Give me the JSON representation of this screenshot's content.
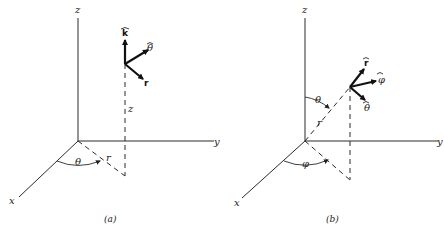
{
  "figure": {
    "panels": [
      {
        "id": "a",
        "caption": "(a)",
        "system": "cylindrical",
        "axis_labels": {
          "x": "x",
          "y": "y",
          "z": "z"
        },
        "unit_vectors": [
          "k̂",
          "θ̂",
          "r"
        ],
        "unit_vector_labels": {
          "k": "k",
          "theta": "θ",
          "r": "r"
        },
        "dimension_labels": {
          "height": "z",
          "radius": "r",
          "angle": "θ"
        }
      },
      {
        "id": "b",
        "caption": "(b)",
        "system": "spherical",
        "axis_labels": {
          "x": "x",
          "y": "y",
          "z": "z"
        },
        "unit_vector_labels": {
          "r": "r",
          "phi": "φ",
          "theta": "θ"
        },
        "dimension_labels": {
          "radius": "r",
          "polar_angle": "θ",
          "azimuth": "φ"
        }
      }
    ]
  }
}
